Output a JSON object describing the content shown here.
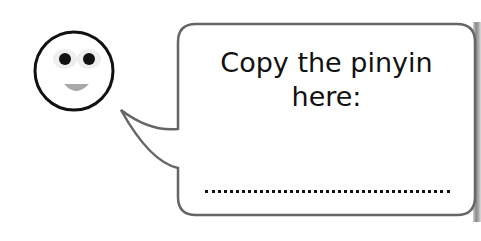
{
  "speech_bubble": {
    "line1": "Copy the pinyin",
    "line2": "here:",
    "answer_placeholder": "................................"
  },
  "colors": {
    "outline": "#666666",
    "face_outline": "#111111",
    "text": "#111111",
    "mouth": "#a0a0a0"
  },
  "icons": [
    "smiley-face-icon"
  ]
}
